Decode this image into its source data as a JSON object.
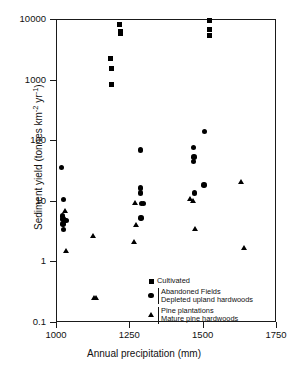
{
  "chart_data": {
    "type": "scatter",
    "title": "",
    "xlabel": "Annual precipitation (mm)",
    "ylabel": "Sediment yield (tonnes km-2 yr-1)",
    "ylabel_parts": {
      "pre": "Sediment yield (tonnes km",
      "sup1": "-2",
      "mid": " yr",
      "sup2": "-1",
      "post": ")"
    },
    "xlim": [
      1000,
      1750
    ],
    "ylim": [
      0.1,
      10000
    ],
    "yscale": "log",
    "xscale": "linear",
    "grid": false,
    "xticks": [
      1000,
      1250,
      1500,
      1750
    ],
    "xtick_labels": [
      "1000",
      "1250",
      "1500",
      "1750"
    ],
    "yticks": [
      0.1,
      1,
      10,
      100,
      1000,
      10000
    ],
    "ytick_labels": [
      "0.1",
      "1",
      "10",
      "100",
      "1000",
      "10000"
    ],
    "legend_position": "lower-right-inside",
    "series": [
      {
        "name": "Cultivated",
        "marker": "square",
        "color": "#000000",
        "points": [
          [
            1185,
            850
          ],
          [
            1185,
            1600
          ],
          [
            1183,
            2350
          ],
          [
            1212,
            8500
          ],
          [
            1215,
            6500
          ],
          [
            1216,
            6000
          ],
          [
            1521,
            10000
          ],
          [
            1521,
            7000
          ],
          [
            1521,
            5500
          ]
        ]
      },
      {
        "name": "Abandoned Fields / Depleted upland hardwoods",
        "marker": "circle",
        "color": "#000000",
        "points": [
          [
            1016,
            37
          ],
          [
            1022,
            11
          ],
          [
            1019,
            5.8
          ],
          [
            1021,
            5.2
          ],
          [
            1020,
            4.3
          ],
          [
            1023,
            3.5
          ],
          [
            1031,
            4.9
          ],
          [
            1285,
            72
          ],
          [
            1284,
            17
          ],
          [
            1285,
            14
          ],
          [
            1288,
            9.4
          ],
          [
            1294,
            9.3
          ],
          [
            1287,
            5.4
          ],
          [
            1465,
            78
          ],
          [
            1467,
            55
          ],
          [
            1466,
            46
          ],
          [
            1468,
            14
          ],
          [
            1501,
            19
          ],
          [
            1502,
            145
          ]
        ]
      },
      {
        "name": "Pine plantations / Mature pine hardwoods",
        "marker": "triangle",
        "color": "#000000",
        "points": [
          [
            1026,
            7.2
          ],
          [
            1030,
            1.55
          ],
          [
            1127,
            0.26
          ],
          [
            1133,
            0.26
          ],
          [
            1122,
            2.7
          ],
          [
            1267,
            9.8
          ],
          [
            1268,
            4.1
          ],
          [
            1264,
            2.2
          ],
          [
            1455,
            11
          ],
          [
            1463,
            10.5
          ],
          [
            1471,
            3.6
          ],
          [
            1627,
            21
          ],
          [
            1636,
            1.75
          ]
        ]
      }
    ]
  },
  "legend": {
    "rows": [
      {
        "marker": "square",
        "lines": [
          "Cultivated"
        ],
        "bracketed": false
      },
      {
        "marker": "circle",
        "lines": [
          "Abandoned Fields",
          "Depleted upland hardwoods"
        ],
        "bracketed": true
      },
      {
        "marker": "triangle",
        "lines": [
          "Pine plantations",
          "Mature pine hardwoods"
        ],
        "bracketed": true
      }
    ]
  }
}
